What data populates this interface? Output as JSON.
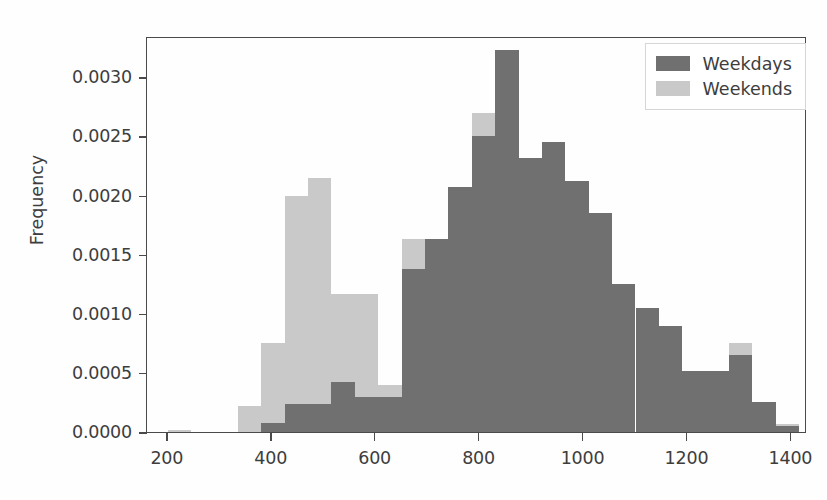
{
  "chart": {
    "title": "",
    "ylabel": "Frequency",
    "xlabel": "",
    "legend": {
      "position": "upper right",
      "entries": [
        {
          "label": "Weekdays",
          "color": "#707070"
        },
        {
          "label": "Weekends",
          "color": "#c9c9c9"
        }
      ]
    },
    "yticks": [
      "0.0000",
      "0.0005",
      "0.0010",
      "0.0015",
      "0.0020",
      "0.0025",
      "0.0030"
    ],
    "xticks": [
      "200",
      "400",
      "600",
      "800",
      "1000",
      "1200",
      "1400"
    ]
  },
  "chart_data": {
    "type": "bar",
    "subtype": "histogram-overlay",
    "title": "",
    "xlabel": "",
    "ylabel": "Frequency",
    "xlim": [
      160,
      1430
    ],
    "ylim": [
      0.0,
      0.00335
    ],
    "grid": false,
    "legend_position": "upper right",
    "bin_width": 45,
    "xtick_values": [
      200,
      400,
      600,
      800,
      1000,
      1200,
      1400
    ],
    "ytick_values": [
      0.0,
      0.0005,
      0.001,
      0.0015,
      0.002,
      0.0025,
      0.003
    ],
    "series": [
      {
        "name": "Weekends",
        "color": "#c9c9c9",
        "bin_edges": [
          200,
          245,
          290,
          335,
          380,
          425,
          470,
          515,
          560,
          605,
          650,
          695,
          740,
          785,
          830,
          875,
          920,
          965,
          1010,
          1055,
          1100,
          1145,
          1190,
          1235,
          1280,
          1325,
          1370,
          1415
        ],
        "values": [
          2e-05,
          0.0,
          0.0,
          0.00022,
          0.00075,
          0.002,
          0.00215,
          0.00117,
          0.00117,
          0.0004,
          0.00163,
          0.00145,
          0.00207,
          0.0027,
          0.00205,
          0.00207,
          0.0013,
          0.0011,
          0.00074,
          0.0005,
          0.0004,
          0.0004,
          0.00052,
          0.00052,
          0.00075,
          0.00018,
          7e-05
        ]
      },
      {
        "name": "Weekdays",
        "color": "#707070",
        "bin_edges": [
          380,
          425,
          470,
          515,
          560,
          605,
          650,
          695,
          740,
          785,
          830,
          875,
          920,
          965,
          1010,
          1055,
          1100,
          1145,
          1190,
          1235,
          1280,
          1325,
          1370,
          1415
        ],
        "values": [
          8e-05,
          0.00024,
          0.00024,
          0.00042,
          0.0003,
          0.0003,
          0.00138,
          0.00163,
          0.00207,
          0.0025,
          0.00323,
          0.00232,
          0.00245,
          0.00212,
          0.00185,
          0.00125,
          0.00105,
          0.0009,
          0.00052,
          0.00052,
          0.00065,
          0.00025,
          5e-05
        ]
      }
    ]
  }
}
